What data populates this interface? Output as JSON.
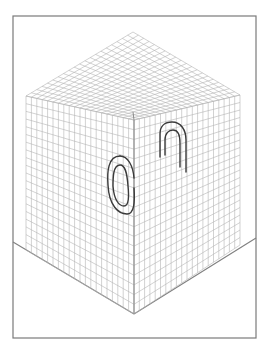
{
  "figure": {
    "title": "Isometric grid cube with paperclip illusion",
    "colors": {
      "background": "#ffffff",
      "frame": "#7a7a7a",
      "grid": "#b4b4b4",
      "edge": "#8a8a8a",
      "floor": "#808080",
      "paperclip": "#3a3a3a"
    },
    "grid_divisions": 20,
    "frame": {
      "x": 13,
      "y": 16,
      "w": 243,
      "h": 322
    },
    "cube": {
      "top": [
        133,
        32
      ],
      "left": [
        26,
        96
      ],
      "right": [
        240,
        95
      ],
      "center": [
        134,
        120
      ],
      "left_bottom": [
        26,
        250
      ],
      "right_bottom": [
        240,
        245
      ],
      "bottom": [
        134,
        314
      ]
    },
    "floor": {
      "left": [
        13,
        242
      ],
      "vertex": [
        134,
        314
      ],
      "right": [
        256,
        238
      ]
    },
    "paperclip": {
      "loop_outer": "M120,156 C108,156 107,172 108,185 C109,205 118,214 127,214 C134,214 135,203 134,188",
      "loop_inner": "M120,165 C113,165 113,178 113,186 C114,200 119,206 124,206 C129,206 129,196 128,186 C127,172 125,165 120,165 Z",
      "loop_outer_top": "M120,156 C128,156 133,166 134,178",
      "arch_outer": "M160,157 L160,134 C160,126 165,122 172,122 C181,122 186,130 186,140 L186,172",
      "arch_inner": "M165,155 L165,140 C165,133 169,130 173,130 C178,130 180,136 180,143 L180,167"
    }
  }
}
